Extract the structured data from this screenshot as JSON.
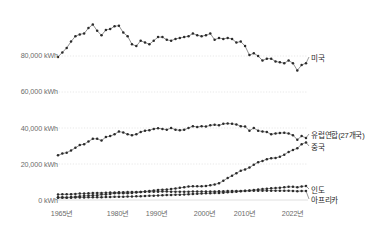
{
  "chart_data": {
    "type": "line",
    "title": "",
    "subtitle": "",
    "xlabel": "",
    "ylabel": "",
    "grid": true,
    "legend_position": "right-inline",
    "xlim": [
      1965,
      2022
    ],
    "ylim": [
      0,
      100000
    ],
    "y_ticks": [
      {
        "value": 0,
        "label": "0 kWh"
      },
      {
        "value": 20000,
        "label": "20,000 kWh"
      },
      {
        "value": 40000,
        "label": "40,000 kWh"
      },
      {
        "value": 60000,
        "label": "60,000 kWh"
      },
      {
        "value": 80000,
        "label": "80,000 kWh"
      }
    ],
    "x_ticks": [
      {
        "value": 1965,
        "label": "1965년"
      },
      {
        "value": 1980,
        "label": "1980년"
      },
      {
        "value": 1990,
        "label": "1990년"
      },
      {
        "value": 2000,
        "label": "2000년"
      },
      {
        "value": 2010,
        "label": "2010년"
      },
      {
        "value": 2022,
        "label": "2022년"
      }
    ],
    "x": [
      1965,
      1966,
      1967,
      1968,
      1969,
      1970,
      1971,
      1972,
      1973,
      1974,
      1975,
      1976,
      1977,
      1978,
      1979,
      1980,
      1981,
      1982,
      1983,
      1984,
      1985,
      1986,
      1987,
      1988,
      1989,
      1990,
      1991,
      1992,
      1993,
      1994,
      1995,
      1996,
      1997,
      1998,
      1999,
      2000,
      2001,
      2002,
      2003,
      2004,
      2005,
      2006,
      2007,
      2008,
      2009,
      2010,
      2011,
      2012,
      2013,
      2014,
      2015,
      2016,
      2017,
      2018,
      2019,
      2020,
      2021,
      2022
    ],
    "series": [
      {
        "name": "미국",
        "color": "#2b2b2b",
        "label": "미국",
        "values": [
          79500,
          82000,
          84500,
          88000,
          91000,
          92000,
          92500,
          95500,
          97500,
          94000,
          91500,
          94500,
          95000,
          96500,
          96800,
          93000,
          91000,
          86500,
          85500,
          88500,
          87500,
          86500,
          88500,
          90500,
          90500,
          89000,
          88500,
          89500,
          90000,
          90500,
          91000,
          92500,
          91500,
          91000,
          91500,
          92500,
          89000,
          90000,
          89500,
          90000,
          89500,
          87500,
          88000,
          85500,
          80500,
          81500,
          80000,
          77500,
          78500,
          78500,
          77000,
          76500,
          76000,
          77500,
          76000,
          72000,
          75000,
          76000
        ]
      },
      {
        "name": "유럽연합(27개국)",
        "color": "#2b2b2b",
        "label": "유럽연합(27개국)",
        "values": [
          24800,
          25800,
          26300,
          27500,
          29000,
          30500,
          31000,
          32500,
          34000,
          34000,
          33000,
          35000,
          35500,
          36500,
          38000,
          37500,
          36500,
          36000,
          36500,
          37800,
          38500,
          38800,
          39500,
          39800,
          39500,
          39000,
          40000,
          39000,
          38800,
          39000,
          40000,
          41000,
          40500,
          41000,
          40800,
          41500,
          41800,
          41500,
          42300,
          42500,
          42300,
          42000,
          41000,
          40800,
          38500,
          40000,
          38500,
          38000,
          37800,
          36500,
          37000,
          37200,
          37300,
          37000,
          36000,
          33500,
          35500,
          34500
        ]
      },
      {
        "name": "중국",
        "color": "#2b2b2b",
        "label": "중국",
        "values": [
          1500,
          1550,
          1450,
          1600,
          1800,
          2100,
          2300,
          2450,
          2600,
          2650,
          3000,
          3100,
          3400,
          3700,
          3800,
          3800,
          3800,
          3950,
          4150,
          4450,
          4750,
          5000,
          5300,
          5600,
          5750,
          5800,
          6100,
          6400,
          6750,
          7100,
          7450,
          7600,
          7600,
          7600,
          7800,
          8200,
          8600,
          9300,
          10700,
          12200,
          13500,
          14900,
          16300,
          17000,
          18000,
          19600,
          21000,
          21700,
          22700,
          23200,
          23400,
          24000,
          25200,
          26700,
          27800,
          28700,
          31000,
          32000
        ]
      },
      {
        "name": "인도",
        "color": "#2b2b2b",
        "label": "인도",
        "values": [
          1200,
          1230,
          1250,
          1300,
          1350,
          1400,
          1430,
          1460,
          1480,
          1500,
          1550,
          1620,
          1680,
          1750,
          1780,
          1800,
          1880,
          1950,
          2020,
          2120,
          2230,
          2320,
          2420,
          2530,
          2650,
          2750,
          2830,
          2900,
          2980,
          3080,
          3250,
          3350,
          3450,
          3550,
          3700,
          3800,
          3850,
          3950,
          4050,
          4250,
          4400,
          4600,
          4850,
          5000,
          5250,
          5600,
          5850,
          6050,
          6200,
          6500,
          6600,
          6800,
          7050,
          7300,
          7350,
          7050,
          7500,
          7800
        ]
      },
      {
        "name": "아프리카",
        "color": "#2b2b2b",
        "label": "아프리카",
        "values": [
          3100,
          3150,
          3150,
          3250,
          3400,
          3550,
          3600,
          3700,
          3850,
          3900,
          3950,
          4050,
          4100,
          4150,
          4250,
          4350,
          4400,
          4450,
          4450,
          4500,
          4550,
          4600,
          4600,
          4650,
          4700,
          4700,
          4650,
          4650,
          4600,
          4600,
          4650,
          4700,
          4700,
          4700,
          4700,
          4750,
          4750,
          4800,
          4850,
          4950,
          5000,
          5000,
          5050,
          5100,
          5100,
          5150,
          5150,
          5150,
          5200,
          5200,
          5200,
          5150,
          5100,
          5100,
          5050,
          4900,
          5000,
          5000
        ]
      }
    ],
    "series_labels": [
      {
        "name": "미국",
        "y_value": 76000,
        "y_px": 57
      },
      {
        "name": "유럽연합(27개국)",
        "y_value": 34500,
        "y_px": 134
      },
      {
        "name": "중국",
        "y_value": 32000,
        "y_px": 146
      },
      {
        "name": "인도",
        "y_value": 7800,
        "y_px": 189
      },
      {
        "name": "아프리카",
        "y_value": 5000,
        "y_px": 199
      }
    ],
    "style": {
      "marker": "dot",
      "marker_color": "#2b2b2b",
      "line_color": "#555555",
      "gridline_color": "#d8d8d8",
      "axis_text_color": "#6b6b6b"
    }
  }
}
